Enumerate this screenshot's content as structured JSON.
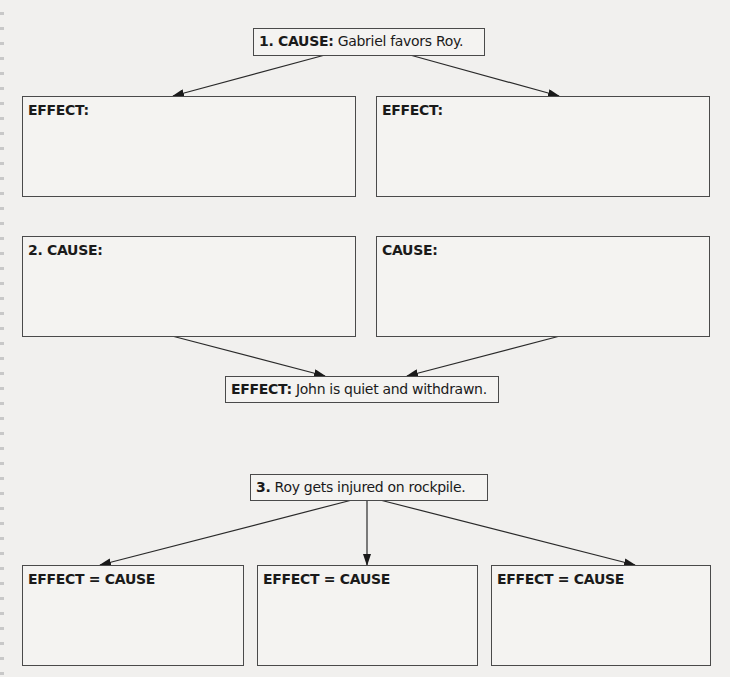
{
  "diagram": {
    "type": "cause-effect graphic organizer",
    "nodes": {
      "cause1": {
        "prefix": "1. CAUSE:",
        "text": " Gabriel favors Roy."
      },
      "effect1_left": {
        "prefix": "EFFECT:",
        "text": ""
      },
      "effect1_right": {
        "prefix": "EFFECT:",
        "text": ""
      },
      "cause2_left": {
        "prefix": "2. CAUSE:",
        "text": ""
      },
      "cause2_right": {
        "prefix": "CAUSE:",
        "text": ""
      },
      "effect2": {
        "prefix": "EFFECT:",
        "text": " John is quiet and withdrawn."
      },
      "cause3": {
        "prefix": "3.",
        "text": " Roy gets injured on rockpile."
      },
      "effect3_a": {
        "prefix": "EFFECT = CAUSE",
        "text": ""
      },
      "effect3_b": {
        "prefix": "EFFECT = CAUSE",
        "text": ""
      },
      "effect3_c": {
        "prefix": "EFFECT = CAUSE",
        "text": ""
      }
    },
    "edges": [
      {
        "from": "cause1",
        "to": "effect1_left"
      },
      {
        "from": "cause1",
        "to": "effect1_right"
      },
      {
        "from": "cause2_left",
        "to": "effect2"
      },
      {
        "from": "cause2_right",
        "to": "effect2"
      },
      {
        "from": "cause3",
        "to": "effect3_a"
      },
      {
        "from": "cause3",
        "to": "effect3_b"
      },
      {
        "from": "cause3",
        "to": "effect3_c"
      }
    ],
    "colors": {
      "line": "#2a2a2a",
      "border": "#4a4a4a",
      "background": "#f1f0ee"
    }
  }
}
